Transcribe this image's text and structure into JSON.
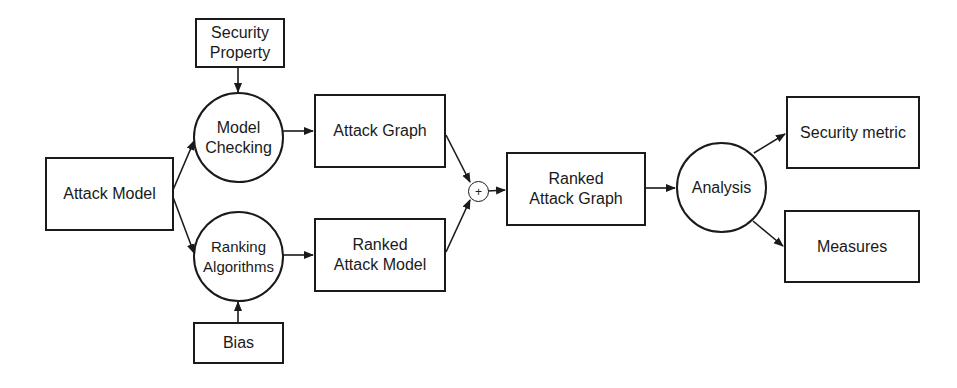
{
  "diagram": {
    "nodes": {
      "security_property": "Security\nProperty",
      "model_checking": "Model\nChecking",
      "attack_model": "Attack Model",
      "ranking_algorithms": "Ranking\nAlgorithms",
      "bias": "Bias",
      "attack_graph": "Attack Graph",
      "ranked_attack_model": "Ranked\nAttack Model",
      "combine": "+",
      "ranked_attack_graph": "Ranked\nAttack Graph",
      "analysis": "Analysis",
      "security_metric": "Security metric",
      "measures": "Measures"
    },
    "edges": [
      [
        "security_property",
        "model_checking"
      ],
      [
        "attack_model",
        "model_checking"
      ],
      [
        "attack_model",
        "ranking_algorithms"
      ],
      [
        "bias",
        "ranking_algorithms"
      ],
      [
        "model_checking",
        "attack_graph"
      ],
      [
        "ranking_algorithms",
        "ranked_attack_model"
      ],
      [
        "attack_graph",
        "combine"
      ],
      [
        "ranked_attack_model",
        "combine"
      ],
      [
        "combine",
        "ranked_attack_graph"
      ],
      [
        "ranked_attack_graph",
        "analysis"
      ],
      [
        "analysis",
        "security_metric"
      ],
      [
        "analysis",
        "measures"
      ]
    ]
  }
}
